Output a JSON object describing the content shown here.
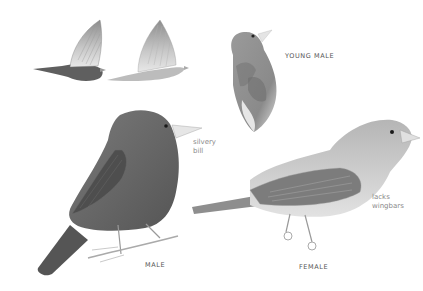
{
  "plate": {
    "background": "#ffffff",
    "figures": [
      {
        "id": "flight-male",
        "description": "male in flight, dark slate body"
      },
      {
        "id": "flight-female",
        "description": "female in flight, pale grey-brown body"
      },
      {
        "id": "young-male",
        "description": "young male, mottled, head tilted up"
      },
      {
        "id": "adult-male",
        "description": "adult male perched on twig"
      },
      {
        "id": "adult-female",
        "description": "adult female perched"
      }
    ],
    "labels": {
      "young_male": "YOUNG MALE",
      "male": "MALE",
      "female": "FEMALE",
      "silvery_bill": "silvery\nbill",
      "lacks_wingbars": "lacks\nwingbars"
    },
    "colors": {
      "male_body": "#6e6e6e",
      "male_dark": "#4a4a4a",
      "female_body": "#b9b9b9",
      "female_light": "#dcdcdc",
      "bill": "#e6e6e6",
      "label_caps": "#555555",
      "label_note": "#8a8a8a"
    }
  }
}
